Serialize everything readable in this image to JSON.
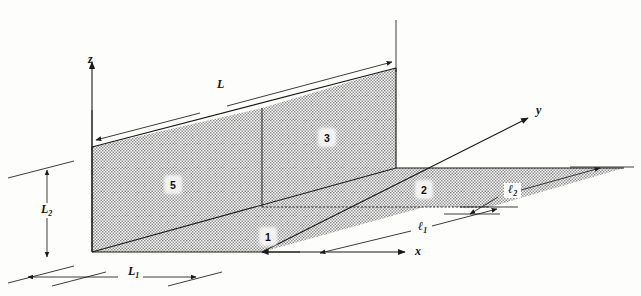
{
  "figure": {
    "background_color": "#fdfdfc",
    "line_color": "#1a1a1a",
    "hatch_fill_color": "#b9b9b9"
  },
  "axes": [
    {
      "name": "z-axis",
      "label": "z",
      "direction": "up",
      "label_x": 88,
      "label_y": 53
    },
    {
      "name": "y-axis",
      "label": "y",
      "direction": "upper-right",
      "label_x": 536,
      "label_y": 104
    },
    {
      "name": "x-axis",
      "label": "x",
      "direction": "right",
      "label_x": 415,
      "label_y": 251
    }
  ],
  "dimensions": [
    {
      "name": "L",
      "base": "L",
      "subscript": "",
      "label_x": 213,
      "label_y": 84,
      "description": "overall length along the wall top"
    },
    {
      "name": "L2",
      "base": "L",
      "subscript": "2",
      "label_x": 40,
      "label_y": 209,
      "description": "wall height, vertical dimension at left"
    },
    {
      "name": "L1",
      "base": "L",
      "subscript": "1",
      "label_x": 128,
      "label_y": 271,
      "description": "horizontal dimension along x at bottom"
    },
    {
      "name": "l1",
      "base": "ℓ",
      "subscript": "1",
      "label_x": 420,
      "label_y": 226,
      "description": "depth dimension of inner floor strip"
    },
    {
      "name": "l2",
      "base": "ℓ",
      "subscript": "2",
      "label_x": 510,
      "label_y": 190,
      "description": "depth dimension of outer floor strip"
    }
  ],
  "regions": [
    {
      "name": "region-5",
      "label": "5",
      "label_x": 173,
      "label_y": 181,
      "surface": "wall-left-panel"
    },
    {
      "name": "region-3",
      "label": "3",
      "label_x": 326,
      "label_y": 134,
      "surface": "wall-right-panel"
    },
    {
      "name": "region-2",
      "label": "2",
      "label_x": 423,
      "label_y": 186,
      "surface": "floor-outer-strip"
    },
    {
      "name": "region-1",
      "label": "1",
      "label_x": 267,
      "label_y": 233,
      "surface": "floor-inner-strip"
    }
  ]
}
